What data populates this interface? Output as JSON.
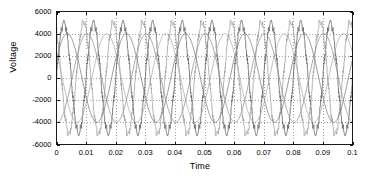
{
  "chart_data": {
    "type": "line",
    "title": "",
    "xlabel": "Time",
    "ylabel": "Voltage",
    "xlim": [
      0,
      0.1
    ],
    "ylim": [
      -6000,
      6000
    ],
    "xticks": [
      "0",
      "0.01",
      "0.02",
      "0.03",
      "0.04",
      "0.05",
      "0.06",
      "0.07",
      "0.08",
      "0.09",
      "0.1"
    ],
    "xtick_values": [
      0,
      0.01,
      0.02,
      0.03,
      0.04,
      0.05,
      0.06,
      0.07,
      0.08,
      0.09,
      0.1
    ],
    "yticks": [
      "-6000",
      "-4000",
      "-2000",
      "0",
      "2000",
      "4000",
      "6000"
    ],
    "ytick_values": [
      -6000,
      -4000,
      -2000,
      0,
      2000,
      4000,
      6000
    ],
    "grid": true,
    "grid_style": "dotted",
    "legend": "none",
    "series": [
      {
        "name": "phase-a-pwm",
        "color": "#555555",
        "waveform": "staircase-pwm",
        "frequency_hz": 100,
        "amplitude": 5000,
        "phase_deg": 0,
        "description": "Stepped multilevel inverter phase voltage, peak about 5000 V, 10 cycles over 0.1 s"
      },
      {
        "name": "phase-b-pwm",
        "color": "#9a9a9a",
        "waveform": "staircase-pwm",
        "frequency_hz": 100,
        "amplitude": 5000,
        "phase_deg": 120,
        "description": "Stepped multilevel inverter phase voltage shifted 120 degrees"
      },
      {
        "name": "phase-a-sine",
        "color": "#777777",
        "waveform": "sine",
        "frequency_hz": 50,
        "amplitude": 4000,
        "phase_deg": 25,
        "description": "Slow fundamental reference sinusoid, peak about 4000 V, 5 cycles over 0.1 s"
      },
      {
        "name": "phase-b-sine",
        "color": "#a8a8a8",
        "waveform": "sine",
        "frequency_hz": 50,
        "amplitude": 4000,
        "phase_deg": 145,
        "description": "Second fundamental reference sinusoid shifted 120 degrees"
      },
      {
        "name": "phase-c-sine",
        "color": "#8c8c8c",
        "waveform": "sine",
        "frequency_hz": 50,
        "amplitude": 4000,
        "phase_deg": 265,
        "description": "Third fundamental reference sinusoid shifted 240 degrees"
      }
    ]
  },
  "figure": {
    "background_color": "#ffffff",
    "axes_color": "#000000",
    "grid_color": "#777777"
  }
}
